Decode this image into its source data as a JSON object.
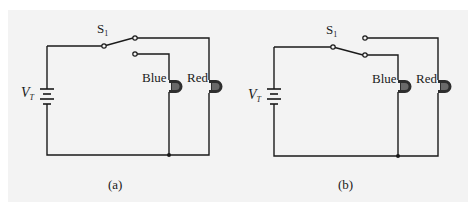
{
  "figure": {
    "background": "#f3f3f3",
    "line_color": "#1a1a1a",
    "panels": [
      {
        "id": "a",
        "caption": "(a)",
        "switch": {
          "label": "S",
          "subscript": "1",
          "position": "upper-contact",
          "connected_to": "Red"
        },
        "source": {
          "label": "V",
          "subscript": "T"
        },
        "lamps": [
          {
            "label": "Blue",
            "lit": false
          },
          {
            "label": "Red",
            "lit": true
          }
        ]
      },
      {
        "id": "b",
        "caption": "(b)",
        "switch": {
          "label": "S",
          "subscript": "1",
          "position": "lower-contact",
          "connected_to": "Blue"
        },
        "source": {
          "label": "V",
          "subscript": "T"
        },
        "lamps": [
          {
            "label": "Blue",
            "lit": true
          },
          {
            "label": "Red",
            "lit": false
          }
        ]
      }
    ]
  }
}
